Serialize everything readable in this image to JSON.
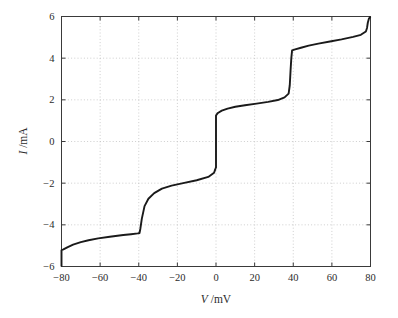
{
  "chart_data": {
    "type": "line",
    "title": "",
    "xlabel": "V /mV",
    "ylabel": "I /mA",
    "xlabel_symbol": "V",
    "xlabel_unit": "/mV",
    "ylabel_symbol": "I",
    "ylabel_unit": "/mA",
    "xlim": [
      -80,
      80
    ],
    "ylim": [
      -6,
      6
    ],
    "xticks": [
      -80,
      -60,
      -40,
      -20,
      0,
      20,
      40,
      60,
      80
    ],
    "xtick_labels": [
      "−80",
      "−60",
      "−40",
      "−20",
      "0",
      "20",
      "40",
      "60",
      "80"
    ],
    "yticks": [
      -6,
      -4,
      -2,
      0,
      2,
      4,
      6
    ],
    "ytick_labels": [
      "−6",
      "−4",
      "−2",
      "0",
      "2",
      "4",
      "6"
    ],
    "grid": true,
    "grid_style": "dotted",
    "legend": false,
    "legend_position": "none",
    "line_color": "#1a1a1a",
    "background_color": "#ffffff",
    "series": [
      {
        "name": "I-V staircase",
        "x": [
          -80.0,
          -80.0,
          -79.0,
          -77.0,
          -74.0,
          -70.0,
          -66.0,
          -61.0,
          -55.0,
          -48.0,
          -44.0,
          -40.5,
          -39.6,
          -39.2,
          -38.4,
          -37.0,
          -35.0,
          -32.0,
          -28.0,
          -23.0,
          -17.0,
          -10.0,
          -4.0,
          -1.0,
          -0.4,
          -0.2,
          0.0,
          0.0,
          0.4,
          1.0,
          3.0,
          6.0,
          10.0,
          15.0,
          21.0,
          27.0,
          32.0,
          35.5,
          37.6,
          38.2,
          38.6,
          39.0,
          39.4,
          41.0,
          44.0,
          48.0,
          53.0,
          59.0,
          65.0,
          71.0,
          75.0,
          77.6,
          78.2,
          78.6,
          79.2,
          80.0
        ],
        "y": [
          -6.0,
          -5.22,
          -5.18,
          -5.08,
          -4.95,
          -4.83,
          -4.74,
          -4.65,
          -4.57,
          -4.49,
          -4.45,
          -4.41,
          -4.39,
          -4.2,
          -3.7,
          -3.1,
          -2.75,
          -2.48,
          -2.26,
          -2.12,
          -2.0,
          -1.86,
          -1.7,
          -1.5,
          -1.34,
          -1.28,
          -1.25,
          1.25,
          1.3,
          1.37,
          1.48,
          1.58,
          1.67,
          1.74,
          1.82,
          1.9,
          1.99,
          2.12,
          2.3,
          2.7,
          3.4,
          4.0,
          4.37,
          4.42,
          4.5,
          4.6,
          4.7,
          4.8,
          4.9,
          5.02,
          5.12,
          5.28,
          5.45,
          5.7,
          5.9,
          6.0
        ]
      }
    ],
    "features": {
      "step_transitions_mV": [
        -39.5,
        0.0,
        39.0,
        78.0
      ],
      "plateau_currents_mA": [
        -4.4,
        -1.3,
        1.3,
        2.3,
        4.4,
        5.3
      ],
      "description": "Coulomb staircase style current-voltage characteristic with sharp current jumps near -40, 0, +40 and +78 mV"
    }
  }
}
